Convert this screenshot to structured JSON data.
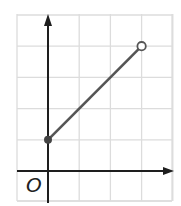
{
  "chart_data": {
    "type": "line",
    "title": "",
    "xlabel": "",
    "ylabel": "",
    "origin_label": "O",
    "grid": true,
    "xlim": [
      -1,
      4
    ],
    "ylim": [
      -1,
      5
    ],
    "grid_step": 1,
    "series": [
      {
        "name": "segment",
        "x": [
          0,
          3
        ],
        "y": [
          1,
          4
        ],
        "start_marker": "closed",
        "end_marker": "open"
      }
    ],
    "tick_labels": []
  },
  "colors": {
    "grid": "#dcdcdc",
    "axis": "#1e1e1e",
    "line": "#555555",
    "closed_point": "#444444",
    "open_point_fill": "#ffffff",
    "open_point_stroke": "#555555"
  }
}
